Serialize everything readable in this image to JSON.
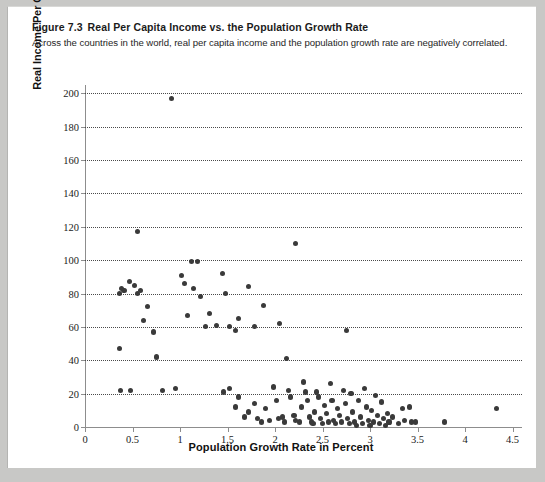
{
  "figure": {
    "number": "Figure 7.3",
    "title": "Real Per Capita Income vs. the Population Growth Rate",
    "subtitle": "Across the countries in the world, real per capita income and the population growth rate are negatively correlated."
  },
  "chart_data": {
    "type": "scatter",
    "title": "Real Per Capita Income vs. the Population Growth Rate",
    "xlabel": "Population Growth Rate in Percent",
    "ylabel": "Real Income Per Capita as a Percentage of the United States",
    "xlim": [
      0,
      4.6
    ],
    "ylim": [
      0,
      205
    ],
    "xticks": [
      0,
      0.5,
      1,
      1.5,
      2,
      2.5,
      3,
      3.5,
      4,
      4.5
    ],
    "xtick_labels": [
      "0",
      "0.5",
      "1",
      "1.5",
      "2",
      "2.5",
      "3",
      "3.5",
      "4",
      "4.5"
    ],
    "yticks": [
      0,
      20,
      40,
      60,
      80,
      100,
      120,
      140,
      160,
      180,
      200
    ],
    "ytick_labels": [
      "0",
      "20",
      "40",
      "60",
      "80",
      "100",
      "120",
      "140",
      "160",
      "180",
      "200"
    ],
    "grid": "horizontal-dotted",
    "legend": "none",
    "marker_color": "#3a3a3a",
    "points": [
      [
        0.91,
        197
      ],
      [
        0.55,
        117
      ],
      [
        1.12,
        99
      ],
      [
        1.18,
        99
      ],
      [
        2.22,
        110
      ],
      [
        0.38,
        83
      ],
      [
        0.41,
        82
      ],
      [
        0.36,
        80
      ],
      [
        0.47,
        87
      ],
      [
        0.52,
        85
      ],
      [
        0.55,
        80
      ],
      [
        0.58,
        82
      ],
      [
        0.36,
        47
      ],
      [
        0.37,
        22
      ],
      [
        0.48,
        22
      ],
      [
        0.62,
        64
      ],
      [
        0.66,
        72
      ],
      [
        0.72,
        57
      ],
      [
        0.75,
        42
      ],
      [
        1.02,
        91
      ],
      [
        1.05,
        86
      ],
      [
        1.08,
        67
      ],
      [
        1.14,
        83
      ],
      [
        1.22,
        78
      ],
      [
        1.27,
        60
      ],
      [
        1.31,
        68
      ],
      [
        1.38,
        61
      ],
      [
        0.82,
        22
      ],
      [
        0.95,
        23
      ],
      [
        1.45,
        92
      ],
      [
        1.48,
        80
      ],
      [
        1.52,
        60
      ],
      [
        1.58,
        58
      ],
      [
        1.62,
        65
      ],
      [
        1.72,
        84
      ],
      [
        1.78,
        60
      ],
      [
        1.88,
        73
      ],
      [
        2.05,
        62
      ],
      [
        2.12,
        41
      ],
      [
        2.75,
        58
      ],
      [
        1.46,
        21
      ],
      [
        1.52,
        23
      ],
      [
        1.58,
        12
      ],
      [
        1.62,
        18
      ],
      [
        1.68,
        6
      ],
      [
        1.72,
        9
      ],
      [
        1.78,
        14
      ],
      [
        1.82,
        5
      ],
      [
        1.86,
        3
      ],
      [
        1.9,
        11
      ],
      [
        1.94,
        4
      ],
      [
        1.98,
        24
      ],
      [
        2.02,
        16
      ],
      [
        2.04,
        5
      ],
      [
        2.08,
        6
      ],
      [
        2.1,
        3
      ],
      [
        2.14,
        22
      ],
      [
        2.16,
        18
      ],
      [
        2.2,
        7
      ],
      [
        2.22,
        4
      ],
      [
        2.26,
        3
      ],
      [
        2.28,
        12
      ],
      [
        2.3,
        27
      ],
      [
        2.32,
        21
      ],
      [
        2.34,
        16
      ],
      [
        2.36,
        6
      ],
      [
        2.38,
        3
      ],
      [
        2.4,
        2
      ],
      [
        2.42,
        9
      ],
      [
        2.44,
        21
      ],
      [
        2.46,
        18
      ],
      [
        2.48,
        5
      ],
      [
        2.5,
        2
      ],
      [
        2.52,
        13
      ],
      [
        2.54,
        8
      ],
      [
        2.56,
        3
      ],
      [
        2.58,
        26
      ],
      [
        2.6,
        16
      ],
      [
        2.62,
        4
      ],
      [
        2.64,
        2
      ],
      [
        2.66,
        11
      ],
      [
        2.68,
        7
      ],
      [
        2.7,
        3
      ],
      [
        2.72,
        22
      ],
      [
        2.74,
        14
      ],
      [
        2.76,
        5
      ],
      [
        2.78,
        2
      ],
      [
        2.8,
        20
      ],
      [
        2.82,
        9
      ],
      [
        2.84,
        3
      ],
      [
        2.86,
        1
      ],
      [
        2.88,
        16
      ],
      [
        2.9,
        6
      ],
      [
        2.92,
        2
      ],
      [
        2.94,
        23
      ],
      [
        2.96,
        12
      ],
      [
        2.98,
        4
      ],
      [
        3.0,
        1
      ],
      [
        3.02,
        10
      ],
      [
        3.04,
        3
      ],
      [
        3.06,
        19
      ],
      [
        3.08,
        7
      ],
      [
        3.1,
        2
      ],
      [
        3.12,
        15
      ],
      [
        3.14,
        5
      ],
      [
        3.16,
        1
      ],
      [
        3.18,
        8
      ],
      [
        3.2,
        3
      ],
      [
        3.24,
        6
      ],
      [
        3.3,
        2
      ],
      [
        3.34,
        11
      ],
      [
        3.36,
        4
      ],
      [
        3.42,
        12
      ],
      [
        3.44,
        3
      ],
      [
        3.48,
        3
      ],
      [
        3.78,
        3
      ],
      [
        4.33,
        11
      ]
    ]
  }
}
